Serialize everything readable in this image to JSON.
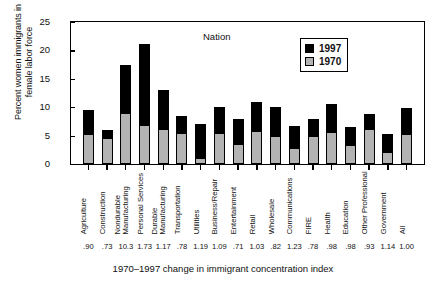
{
  "chart_data": {
    "type": "bar",
    "title": "",
    "annotation": "Nation",
    "xlabel": "1970–1997 change in immigrant concentration index",
    "ylabel_lines": [
      "Percent women immigrants in",
      "female labor force"
    ],
    "ylim": [
      0,
      25
    ],
    "yticks": [
      0,
      5,
      10,
      15,
      20,
      25
    ],
    "ytick_labels": [
      "0",
      "5",
      "10",
      "15",
      "20",
      "25"
    ],
    "grid": false,
    "stacked": true,
    "legend_position": "top-right",
    "legend": [
      {
        "name": "1997",
        "color": "#000000"
      },
      {
        "name": "1970",
        "color": "#b3b3b3"
      }
    ],
    "categories": [
      "Agriculture",
      "Construction",
      "Nondurable Manufacturing",
      "Personal Services",
      "Durable Manufacturing",
      "Transportation",
      "Utilities",
      "Business/Repair",
      "Entertainment",
      "Retail",
      "Wholesale",
      "Communications",
      "FIRE",
      "Health",
      "Education",
      "Other Professional",
      "Government",
      "All"
    ],
    "category_label_lines": [
      [
        "Agriculture"
      ],
      [
        "Construction"
      ],
      [
        "Nondurable",
        "Manufacturing"
      ],
      [
        "Personal Services"
      ],
      [
        "Durable",
        "Manufacturing"
      ],
      [
        "Transportation"
      ],
      [
        "Utilities"
      ],
      [
        "Business/Repair"
      ],
      [
        "Entertainment"
      ],
      [
        "Retail"
      ],
      [
        "Wholesale"
      ],
      [
        "Communications"
      ],
      [
        "FIRE"
      ],
      [
        "Health"
      ],
      [
        "Education"
      ],
      [
        "Other Professional"
      ],
      [
        "Government"
      ],
      [
        "All"
      ]
    ],
    "series": [
      {
        "name": "1997",
        "values": [
          9.5,
          6.0,
          17.4,
          21.1,
          13.0,
          8.5,
          7.0,
          10.1,
          8.0,
          11.0,
          10.0,
          6.7,
          8.0,
          10.5,
          6.5,
          8.8,
          5.3,
          9.8
        ]
      },
      {
        "name": "1970",
        "values": [
          5.3,
          4.5,
          8.9,
          6.8,
          6.2,
          5.5,
          1.0,
          5.5,
          3.5,
          5.8,
          5.0,
          2.9,
          5.0,
          5.7,
          3.4,
          6.2,
          2.2,
          5.3
        ]
      }
    ],
    "index_values": [
      ".90",
      ".73",
      "10.3",
      "1.73",
      "1.17",
      ".78",
      "1.19",
      "1.09",
      ".71",
      "1.03",
      ".82",
      "1.23",
      ".78",
      ".98",
      ".98",
      ".93",
      "1.14",
      "1.00"
    ]
  }
}
